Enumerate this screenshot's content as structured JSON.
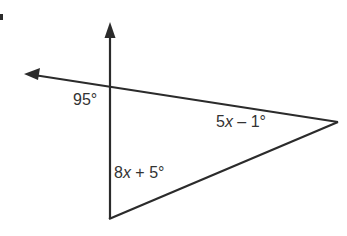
{
  "diagram": {
    "type": "geometry-triangle-exterior-angle",
    "labels": {
      "exterior_angle": "95°",
      "right_angle_prefix": "5",
      "right_angle_var": "x",
      "right_angle_suffix": " – 1°",
      "bottom_angle_prefix": "8",
      "bottom_angle_var": "x",
      "bottom_angle_suffix": " + 5°"
    },
    "colors": {
      "stroke": "#2b2b2b",
      "text": "#333333",
      "background": "#ffffff"
    }
  }
}
